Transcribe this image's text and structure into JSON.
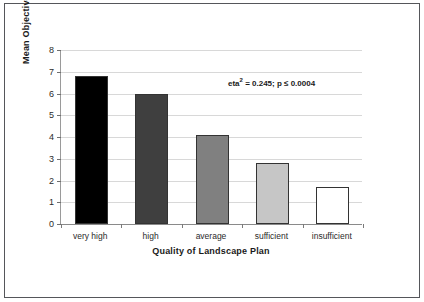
{
  "chart_data": {
    "type": "bar",
    "title": "",
    "categories": [
      "very high",
      "high",
      "average",
      "sufficient",
      "insufficient"
    ],
    "values": [
      6.8,
      6.0,
      4.1,
      2.8,
      1.7
    ],
    "xlabel": "Quality of Landscape Plan",
    "ylabel": "Mean Objectives",
    "ylim": [
      0,
      8
    ],
    "yticks": [
      0,
      1,
      2,
      3,
      4,
      5,
      6,
      7,
      8
    ],
    "ytick_labels": [
      "0",
      "1",
      "2",
      "3",
      "4",
      "5",
      "6",
      "7",
      "8"
    ],
    "grid": true,
    "legend": false,
    "bar_colors": [
      "#000000",
      "#3f3f3f",
      "#808080",
      "#c6c6c6",
      "#ffffff"
    ],
    "bar_edge_color": "#333333",
    "annotations": [
      {
        "name": "eta-squared-p-value",
        "text_prefix": "eta",
        "text_superscript": "2",
        "text_suffix": " = 0.245; p ≤ 0.0004"
      }
    ]
  },
  "figure": {
    "background_color": "#ffffff",
    "frame_color": "#55565a",
    "gridline_color": "#d8d8d8",
    "axis_color": "#8a8a8a"
  }
}
